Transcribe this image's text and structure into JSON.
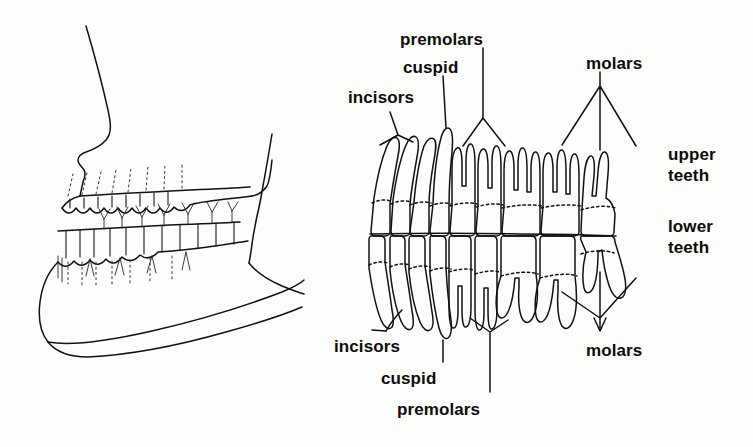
{
  "figure": {
    "background_color": "#fdfdfb",
    "ink_color": "#12100e"
  },
  "panels": {
    "left": {
      "name": "lateral-jaw-profile",
      "description": "Side view line drawing of maxilla and mandible with teeth in occlusion"
    },
    "right": {
      "name": "tooth-arch-detail",
      "description": "Frontal view of upper and lower teeth with roots, labeled by tooth type"
    }
  },
  "labels": {
    "top": [
      {
        "id": "premolars-upper",
        "text": "premolars",
        "x": 400,
        "y": 30,
        "leader": "fan-2"
      },
      {
        "id": "cuspid-upper",
        "text": "cuspid",
        "x": 403,
        "y": 58,
        "leader": "single"
      },
      {
        "id": "incisors-upper",
        "text": "incisors",
        "x": 348,
        "y": 88,
        "leader": "fan-2"
      },
      {
        "id": "molars-upper",
        "text": "molars",
        "x": 586,
        "y": 54,
        "leader": "fan-3"
      }
    ],
    "right": [
      {
        "id": "upper-teeth",
        "text_line1": "upper",
        "text_line2": "teeth",
        "x": 668,
        "y": 144
      },
      {
        "id": "lower-teeth",
        "text_line1": "lower",
        "text_line2": "teeth",
        "x": 668,
        "y": 216
      }
    ],
    "bottom": [
      {
        "id": "incisors-lower",
        "text": "incisors",
        "x": 334,
        "y": 337,
        "leader": "single"
      },
      {
        "id": "cuspid-lower",
        "text": "cuspid",
        "x": 381,
        "y": 369,
        "leader": "single"
      },
      {
        "id": "premolars-lower",
        "text": "premolars",
        "x": 397,
        "y": 400,
        "leader": "single"
      },
      {
        "id": "molars-lower",
        "text": "molars",
        "x": 586,
        "y": 341,
        "leader": "fan-3"
      }
    ]
  },
  "tooth_types": [
    "incisors",
    "cuspid",
    "premolars",
    "molars"
  ],
  "arches": [
    "upper teeth",
    "lower teeth"
  ]
}
